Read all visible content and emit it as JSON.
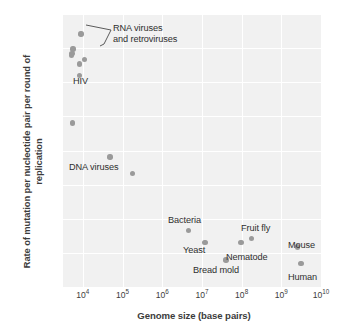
{
  "chart_data": {
    "type": "scatter",
    "title": "",
    "xlabel": "Genome size (base pairs)",
    "ylabel": "Rate of mutation per nucleotide pair per round of replication",
    "xscale": "log",
    "yscale": "log",
    "xlim": [
      3162,
      10000000000
    ],
    "ylim": [
      1e-11,
      0.001
    ],
    "grid": true,
    "legend": null,
    "xticks": [
      {
        "label": "10",
        "exp": "4",
        "value": 10000
      },
      {
        "label": "10",
        "exp": "5",
        "value": 100000
      },
      {
        "label": "10",
        "exp": "6",
        "value": 1000000
      },
      {
        "label": "10",
        "exp": "7",
        "value": 10000000
      },
      {
        "label": "10",
        "exp": "8",
        "value": 100000000
      },
      {
        "label": "10",
        "exp": "9",
        "value": 1000000000
      },
      {
        "label": "10",
        "exp": "10",
        "value": 10000000000
      }
    ],
    "yticks": [
      {
        "label": "10",
        "exp": "−3",
        "value": 0.001
      },
      {
        "label": "10",
        "exp": "−4",
        "value": 0.0001
      },
      {
        "label": "10",
        "exp": "−5",
        "value": 1e-05
      },
      {
        "label": "10",
        "exp": "−6",
        "value": 1e-06
      },
      {
        "label": "10",
        "exp": "−7",
        "value": 1e-07
      },
      {
        "label": "10",
        "exp": "−8",
        "value": 1e-08
      },
      {
        "label": "10",
        "exp": "−9",
        "value": 1e-09
      },
      {
        "label": "10",
        "exp": "−10",
        "value": 1e-10
      },
      {
        "label": "10",
        "exp": "−11",
        "value": 1e-11
      }
    ],
    "points": [
      {
        "name": "rna-virus-1",
        "x": 9000,
        "y": 0.00026,
        "group": "RNA viruses and retroviruses"
      },
      {
        "name": "rna-virus-2",
        "x": 5600,
        "y": 9.5e-05,
        "group": "RNA viruses and retroviruses"
      },
      {
        "name": "rna-virus-3",
        "x": 5300,
        "y": 7e-05,
        "group": "RNA viruses and retroviruses"
      },
      {
        "name": "rna-virus-4",
        "x": 5200,
        "y": 6.2e-05,
        "group": "RNA viruses and retroviruses"
      },
      {
        "name": "rna-virus-5",
        "x": 11000,
        "y": 4.6e-05,
        "group": "RNA viruses and retroviruses"
      },
      {
        "name": "hiv",
        "x": 8300,
        "y": 3.4e-05,
        "group": "HIV"
      },
      {
        "name": "hiv-low",
        "x": 8300,
        "y": 1.6e-05,
        "group": "HIV"
      },
      {
        "name": "dna-virus-1",
        "x": 5500,
        "y": 6.4e-07,
        "group": "DNA viruses"
      },
      {
        "name": "dna-virus-2",
        "x": 48000,
        "y": 6.4e-08,
        "group": "DNA viruses"
      },
      {
        "name": "dna-virus-3",
        "x": 180000,
        "y": 2.1e-08,
        "group": "DNA viruses"
      },
      {
        "name": "bacteria",
        "x": 4600000,
        "y": 4.6e-10,
        "group": "Bacteria"
      },
      {
        "name": "yeast",
        "x": 12000000,
        "y": 2e-10,
        "group": "Yeast"
      },
      {
        "name": "bread-mold",
        "x": 40000000,
        "y": 6.2e-11,
        "group": "Bread mold"
      },
      {
        "name": "nematode",
        "x": 97000000,
        "y": 2e-10,
        "group": "Nematode"
      },
      {
        "name": "fruit-fly",
        "x": 180000000,
        "y": 2.6e-10,
        "group": "Fruit fly"
      },
      {
        "name": "mouse",
        "x": 2600000000,
        "y": 1.5e-10,
        "group": "Mouse"
      },
      {
        "name": "human",
        "x": 3100000000,
        "y": 4.8e-11,
        "group": "Human"
      }
    ],
    "annotations": [
      {
        "name": "rna-viruses-label",
        "text": "RNA viruses\nand retroviruses",
        "x": 113,
        "y": 23
      },
      {
        "name": "hiv-label",
        "text": "HIV",
        "x": 73,
        "y": 76
      },
      {
        "name": "dna-viruses-label",
        "text": "DNA viruses",
        "x": 69,
        "y": 162
      },
      {
        "name": "bacteria-label",
        "text": "Bacteria",
        "x": 168,
        "y": 215
      },
      {
        "name": "yeast-label",
        "text": "Yeast",
        "x": 183,
        "y": 245
      },
      {
        "name": "bread-mold-label",
        "text": "Bread mold",
        "x": 193,
        "y": 265
      },
      {
        "name": "nematode-label",
        "text": "Nematode",
        "x": 226,
        "y": 252
      },
      {
        "name": "fruit-fly-label",
        "text": "Fruit fly",
        "x": 241,
        "y": 223
      },
      {
        "name": "mouse-label",
        "text": "Mouse",
        "x": 288,
        "y": 240
      },
      {
        "name": "human-label",
        "text": "Human",
        "x": 288,
        "y": 272
      }
    ]
  }
}
